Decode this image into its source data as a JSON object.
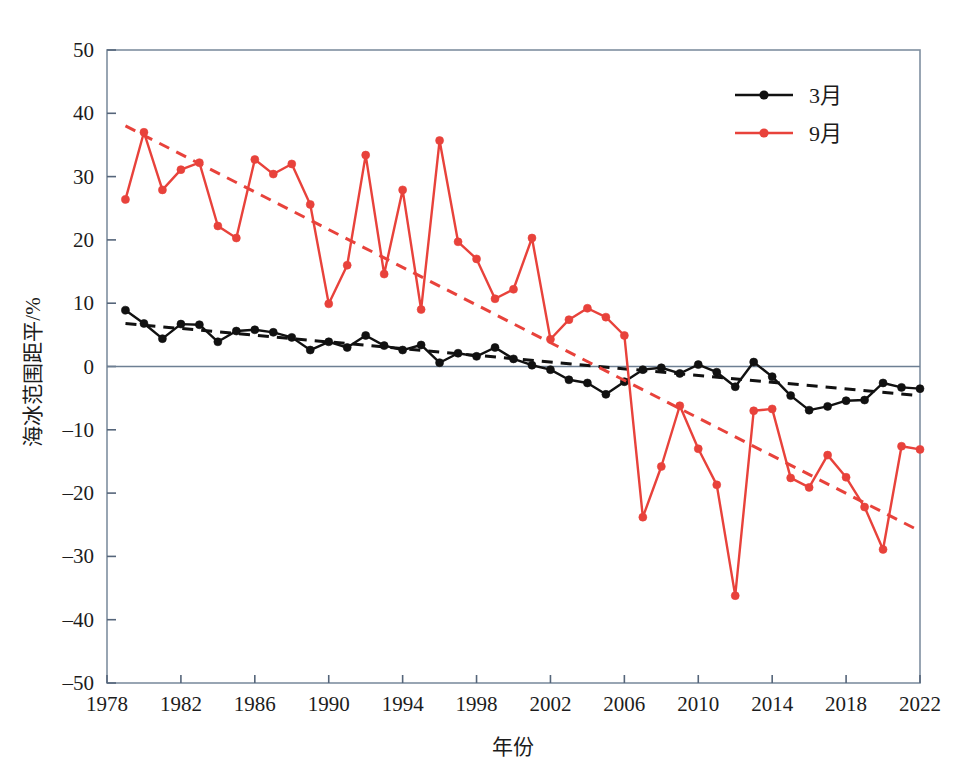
{
  "chart_data": {
    "type": "line",
    "title": "",
    "xlabel": "年份",
    "ylabel": "海冰范围距平/%",
    "xlim": [
      1978,
      2022
    ],
    "ylim": [
      -50,
      50
    ],
    "xticks": [
      1978,
      1982,
      1986,
      1990,
      1994,
      1998,
      2002,
      2006,
      2010,
      2014,
      2018,
      2022
    ],
    "xtick_labels": [
      "1978",
      "1982",
      "1986",
      "1990",
      "1994",
      "1998",
      "2002",
      "2006",
      "2010",
      "2014",
      "2018",
      "2022"
    ],
    "yticks": [
      50,
      40,
      30,
      20,
      10,
      0,
      -10,
      -20,
      -30,
      -40,
      -50
    ],
    "ytick_labels": [
      "50",
      "40",
      "30",
      "20",
      "10",
      "0",
      "-10",
      "-20",
      "-30",
      "-40",
      "-50"
    ],
    "grid": false,
    "legend_position": "top-right",
    "zero_line": true,
    "x": [
      1979,
      1980,
      1981,
      1982,
      1983,
      1984,
      1985,
      1986,
      1987,
      1988,
      1989,
      1990,
      1991,
      1992,
      1993,
      1994,
      1995,
      1996,
      1997,
      1998,
      1999,
      2000,
      2001,
      2002,
      2003,
      2004,
      2005,
      2006,
      2007,
      2008,
      2009,
      2010,
      2011,
      2012,
      2013,
      2014,
      2015,
      2016,
      2017,
      2018,
      2019,
      2020,
      2021,
      2022
    ],
    "series": [
      {
        "name": "3月",
        "label": "3月",
        "color": "#111111",
        "marker": "circle",
        "values": [
          8.9,
          6.8,
          4.4,
          6.7,
          6.6,
          3.9,
          5.6,
          5.8,
          5.4,
          4.6,
          2.6,
          3.9,
          3.0,
          4.9,
          3.3,
          2.6,
          3.4,
          0.6,
          2.1,
          1.6,
          3.0,
          1.2,
          0.2,
          -0.5,
          -2.1,
          -2.6,
          -4.4,
          -2.4,
          -0.5,
          -0.2,
          -1.1,
          0.3,
          -0.9,
          -3.2,
          0.7,
          -1.6,
          -4.6,
          -6.9,
          -6.3,
          -5.4,
          -5.3,
          -2.6,
          -3.3,
          -3.5
        ],
        "trend": {
          "style": "dashed",
          "x_start": 1979,
          "y_start": 6.8,
          "x_end": 2022,
          "y_end": -4.6
        }
      },
      {
        "name": "9月",
        "label": "9月",
        "color": "#e8423b",
        "marker": "circle",
        "values": [
          26.4,
          37.0,
          27.9,
          31.1,
          32.2,
          22.2,
          20.3,
          32.7,
          30.4,
          32.0,
          25.6,
          9.9,
          16.0,
          33.4,
          14.6,
          27.9,
          9.0,
          35.7,
          19.7,
          17.0,
          10.7,
          12.2,
          20.3,
          4.3,
          7.4,
          9.2,
          7.8,
          4.9,
          -23.8,
          -15.8,
          -6.2,
          -13.0,
          -18.7,
          -36.2,
          -7.0,
          -6.7,
          -17.6,
          -19.1,
          -14.0,
          -17.5,
          -22.2,
          -28.9,
          -12.6,
          -13.1
        ],
        "trend": {
          "style": "dashed",
          "x_start": 1979,
          "y_start": 38.0,
          "x_end": 2022,
          "y_end": -26.0
        }
      }
    ]
  },
  "legend": {
    "entries": [
      {
        "label": "3月",
        "color": "#111111"
      },
      {
        "label": "9月",
        "color": "#e8423b"
      }
    ]
  },
  "axes": {
    "x_title": "年份",
    "y_title": "海冰范围距平/%"
  }
}
